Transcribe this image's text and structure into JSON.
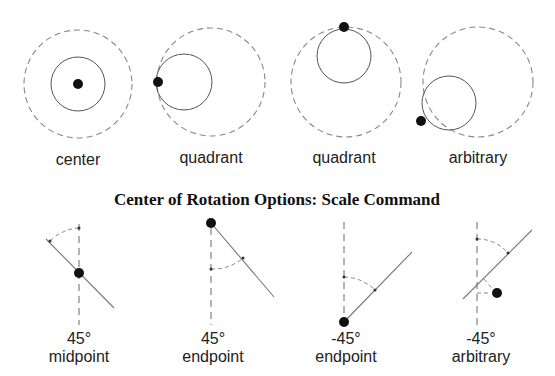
{
  "title": "Center of Rotation Options: Scale Command",
  "top_row": {
    "description": "Scale center options",
    "items": [
      {
        "label": "center",
        "dashed": {
          "cx": 78,
          "cy": 84,
          "r": 54
        },
        "solid": {
          "cx": 78,
          "cy": 84,
          "r": 27
        },
        "point": {
          "cx": 78,
          "cy": 84
        }
      },
      {
        "label": "quadrant",
        "dashed": {
          "cx": 211,
          "cy": 82,
          "r": 54
        },
        "solid": {
          "cx": 184,
          "cy": 82,
          "r": 28
        },
        "point": {
          "cx": 158,
          "cy": 82
        }
      },
      {
        "label": "quadrant",
        "dashed": {
          "cx": 346,
          "cy": 82,
          "r": 55
        },
        "solid": {
          "cx": 344,
          "cy": 56,
          "r": 27
        },
        "point": {
          "cx": 344,
          "cy": 27
        }
      },
      {
        "label": "arbitrary",
        "dashed": {
          "cx": 477,
          "cy": 82,
          "r": 55
        },
        "solid": {
          "cx": 449,
          "cy": 103,
          "r": 27
        },
        "point": {
          "cx": 421,
          "cy": 121
        }
      }
    ]
  },
  "bottom_row": {
    "description": "Rotation center options",
    "items": [
      {
        "angle": "45°",
        "label": "midpoint"
      },
      {
        "angle": "45°",
        "label": "endpoint"
      },
      {
        "angle": "-45°",
        "label": "endpoint"
      },
      {
        "angle": "-45°",
        "label": "arbitrary"
      }
    ]
  },
  "colors": {
    "point": "#111111",
    "dashed": "#888888",
    "solid": "#555555",
    "background": "#ffffff"
  }
}
